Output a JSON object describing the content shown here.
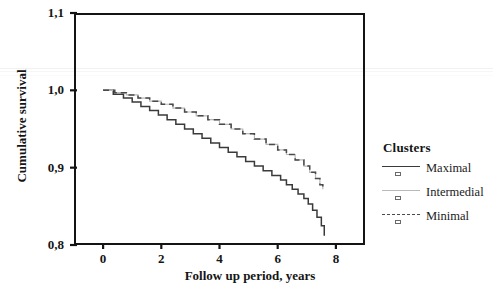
{
  "chart_data": {
    "type": "line",
    "subtype": "kaplan-meier-step",
    "title": "",
    "xlabel": "Follow up period, years",
    "ylabel": "Cumulative survival",
    "xlim": [
      -1.0,
      9.0
    ],
    "ylim": [
      0.8,
      1.1
    ],
    "xticks": [
      "0",
      "2",
      "4",
      "6",
      "8"
    ],
    "xtick_values": [
      0,
      2,
      4,
      6,
      8
    ],
    "yticks": [
      "1,1",
      "1,0",
      "0,9",
      "0,8"
    ],
    "ytick_values": [
      1.1,
      1.0,
      0.9,
      0.8
    ],
    "grid": false,
    "legend_position": "right",
    "legend_title": "Clusters",
    "series": [
      {
        "name": "Maximal",
        "style": "solid",
        "color": "#3a3a3a",
        "x": [
          0.0,
          0.35,
          0.7,
          1.0,
          1.3,
          1.6,
          1.9,
          2.2,
          2.5,
          2.8,
          3.1,
          3.4,
          3.7,
          4.0,
          4.3,
          4.6,
          4.9,
          5.2,
          5.5,
          5.8,
          6.1,
          6.3,
          6.5,
          6.7,
          6.9,
          7.05,
          7.2,
          7.35,
          7.5,
          7.6
        ],
        "y": [
          1.0,
          0.995,
          0.99,
          0.985,
          0.979,
          0.974,
          0.968,
          0.962,
          0.956,
          0.95,
          0.944,
          0.938,
          0.932,
          0.926,
          0.92,
          0.914,
          0.908,
          0.902,
          0.896,
          0.89,
          0.884,
          0.878,
          0.872,
          0.866,
          0.86,
          0.853,
          0.845,
          0.836,
          0.825,
          0.812
        ]
      },
      {
        "name": "Intermedial",
        "style": "solid-light",
        "color": "#b9b9b9",
        "x": [
          0.0,
          0.4,
          0.8,
          1.2,
          1.6,
          2.0,
          2.4,
          2.8,
          3.2,
          3.6,
          4.0,
          4.4,
          4.8,
          5.2,
          5.6,
          6.0,
          6.3,
          6.6,
          6.9,
          7.1,
          7.3,
          7.45,
          7.55
        ],
        "y": [
          1.0,
          0.997,
          0.994,
          0.99,
          0.986,
          0.982,
          0.977,
          0.972,
          0.967,
          0.962,
          0.956,
          0.95,
          0.944,
          0.937,
          0.93,
          0.923,
          0.917,
          0.91,
          0.902,
          0.894,
          0.886,
          0.878,
          0.872
        ]
      },
      {
        "name": "Minimal",
        "style": "dashed",
        "color": "#4a4a4a",
        "x": [
          0.0,
          0.4,
          0.8,
          1.2,
          1.6,
          2.0,
          2.4,
          2.8,
          3.2,
          3.6,
          4.0,
          4.4,
          4.8,
          5.2,
          5.6,
          6.0,
          6.3,
          6.6,
          6.9,
          7.1,
          7.3,
          7.45,
          7.55
        ],
        "y": [
          1.0,
          0.997,
          0.994,
          0.99,
          0.986,
          0.982,
          0.977,
          0.972,
          0.967,
          0.962,
          0.956,
          0.95,
          0.944,
          0.937,
          0.93,
          0.923,
          0.917,
          0.91,
          0.902,
          0.894,
          0.886,
          0.878,
          0.873
        ]
      }
    ]
  },
  "axes": {
    "y_title": "Cumulative survival",
    "x_title": "Follow up period, years"
  },
  "legend": {
    "title": "Clusters",
    "items": [
      {
        "label": "Maximal",
        "color": "#3a3a3a",
        "dash": "none"
      },
      {
        "label": "Intermedial",
        "color": "#b9b9b9",
        "dash": "none"
      },
      {
        "label": "Minimal",
        "color": "#4a4a4a",
        "dash": "dashed"
      }
    ]
  }
}
